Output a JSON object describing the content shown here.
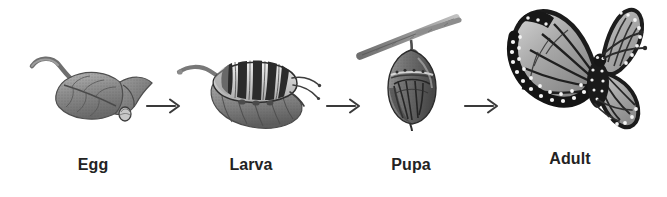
{
  "figure": {
    "background_color": "#ffffff",
    "ink_color": "#232323",
    "style": "grayscale halftone scientific illustration"
  },
  "stages": [
    {
      "id": "egg",
      "label": "Egg",
      "icon": "leaf-with-egg-icon",
      "description": "Single egg on the folded tip of a leaf with a curved stem",
      "order": 1
    },
    {
      "id": "larva",
      "label": "Larva",
      "icon": "caterpillar-on-leaf-icon",
      "description": "Black and white banded monarch caterpillar resting on a leaf",
      "order": 2
    },
    {
      "id": "pupa",
      "label": "Pupa",
      "icon": "chrysalis-on-twig-icon",
      "description": "Chrysalis hanging by silk from a diagonal twig",
      "order": 3
    },
    {
      "id": "adult",
      "label": "Adult",
      "icon": "monarch-butterfly-icon",
      "description": "Adult monarch butterfly with white-spotted black wing margins and long antennae",
      "order": 4
    }
  ],
  "arrows": [
    {
      "id": "arrow-egg-to-larva",
      "glyph": "right-arrow-icon",
      "from": "Egg",
      "to": "Larva"
    },
    {
      "id": "arrow-larva-to-pupa",
      "glyph": "right-arrow-icon",
      "from": "Larva",
      "to": "Pupa"
    },
    {
      "id": "arrow-pupa-to-adult",
      "glyph": "right-arrow-icon",
      "from": "Pupa",
      "to": "Adult"
    }
  ]
}
